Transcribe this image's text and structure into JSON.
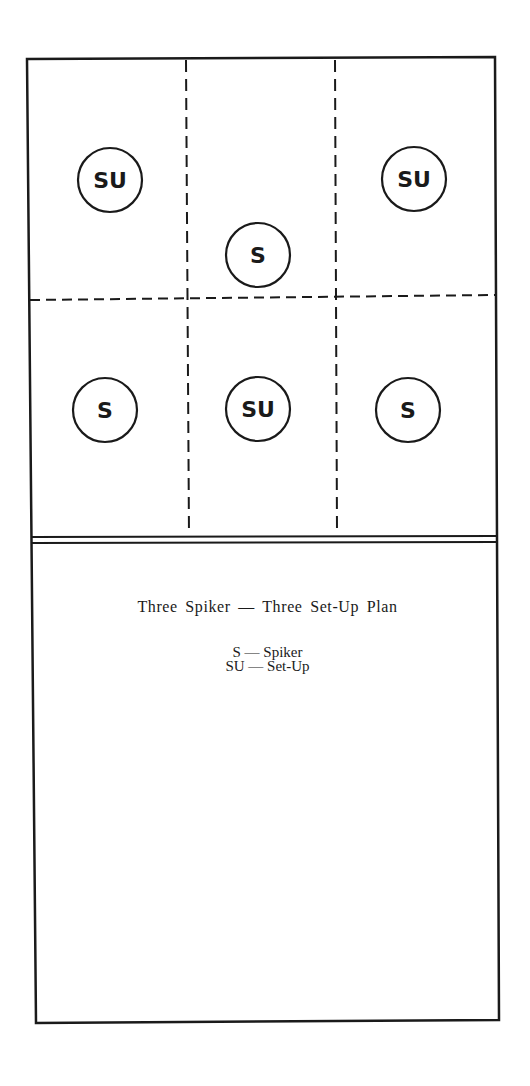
{
  "diagram": {
    "title": "Three Spiker — Three Set-Up Plan",
    "legend": [
      {
        "code": "S",
        "meaning": "Spiker",
        "text": "S — Spiker"
      },
      {
        "code": "SU",
        "meaning": "Set-Up",
        "text": "SU — Set-Up"
      }
    ],
    "court": {
      "zones": "2 rows x 3 columns",
      "players": [
        {
          "label": "SU",
          "row": "back",
          "col": "left"
        },
        {
          "label": "S",
          "row": "back",
          "col": "center"
        },
        {
          "label": "SU",
          "row": "back",
          "col": "right"
        },
        {
          "label": "S",
          "row": "front",
          "col": "left"
        },
        {
          "label": "SU",
          "row": "front",
          "col": "center"
        },
        {
          "label": "S",
          "row": "front",
          "col": "right"
        }
      ]
    },
    "colors": {
      "ink": "#1a1a1a",
      "paper": "#ffffff"
    }
  }
}
